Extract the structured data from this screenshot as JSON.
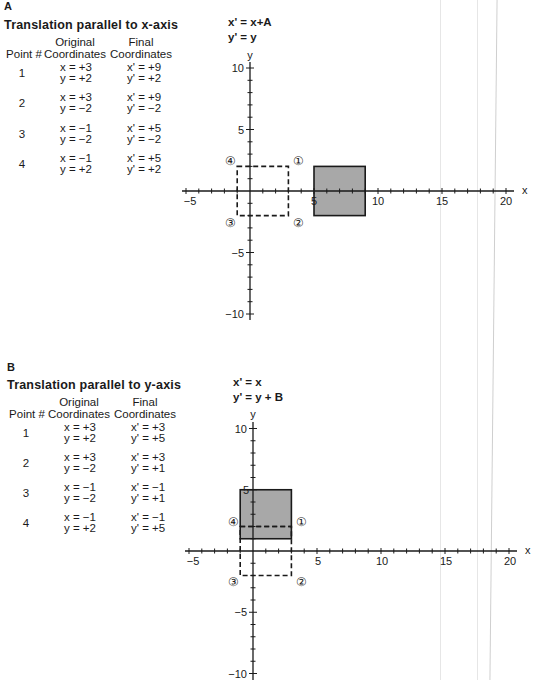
{
  "panels": [
    {
      "letter": "A",
      "title": "Translation parallel to x-axis",
      "headers": {
        "point": "Point #",
        "original_line1": "Original",
        "original_line2": "Coordinates",
        "final_line1": "Final",
        "final_line2": "Coordinates"
      },
      "rows": [
        {
          "point": "1",
          "ox": "x = +3",
          "oy": "y = +2",
          "fx": "x' = +9",
          "fy": "y' = +2"
        },
        {
          "point": "2",
          "ox": "x = +3",
          "oy": "y = −2",
          "fx": "x' = +9",
          "fy": "y' = −2"
        },
        {
          "point": "3",
          "ox": "x = −1",
          "oy": "y = −2",
          "fx": "x' = +5",
          "fy": "y' = −2"
        },
        {
          "point": "4",
          "ox": "x = −1",
          "oy": "y = +2",
          "fx": "x' = +5",
          "fy": "y' = +2"
        }
      ],
      "equations": {
        "line1": "x' = x+A",
        "line2": "y' = y"
      },
      "graph": {
        "x_label": "x",
        "y_label": "y",
        "x_ticks": [
          "−5",
          "5",
          "10",
          "15",
          "20"
        ],
        "y_ticks": [
          "10",
          "5",
          "−5",
          "−10"
        ],
        "point_markers": [
          "①",
          "②",
          "③",
          "④"
        ],
        "original_rect": {
          "x1": -1,
          "x2": 3,
          "y1": -2,
          "y2": 2
        },
        "final_rect": {
          "x1": 5,
          "x2": 9,
          "y1": -2,
          "y2": 2
        }
      }
    },
    {
      "letter": "B",
      "title": "Translation parallel to y-axis",
      "headers": {
        "point": "Point #",
        "original_line1": "Original",
        "original_line2": "Coordinates",
        "final_line1": "Final",
        "final_line2": "Coordinates"
      },
      "rows": [
        {
          "point": "1",
          "ox": "x = +3",
          "oy": "y = +2",
          "fx": "x' = +3",
          "fy": "y' = +5"
        },
        {
          "point": "2",
          "ox": "x = +3",
          "oy": "y = −2",
          "fx": "x' = +3",
          "fy": "y' = +1"
        },
        {
          "point": "3",
          "ox": "x = −1",
          "oy": "y = −2",
          "fx": "x' = −1",
          "fy": "y' = +1"
        },
        {
          "point": "4",
          "ox": "x = −1",
          "oy": "y = +2",
          "fx": "x' = −1",
          "fy": "y' = +5"
        }
      ],
      "equations": {
        "line1": "x' = x",
        "line2": "y' = y + B"
      },
      "graph": {
        "x_label": "x",
        "y_label": "y",
        "x_ticks": [
          "−5",
          "5",
          "10",
          "15",
          "20"
        ],
        "y_ticks": [
          "10",
          "5",
          "−5",
          "−10"
        ],
        "point_markers": [
          "①",
          "②",
          "③",
          "④"
        ],
        "original_rect": {
          "x1": -1,
          "x2": 3,
          "y1": -2,
          "y2": 2
        },
        "final_rect": {
          "x1": -1,
          "x2": 3,
          "y1": 1,
          "y2": 5
        }
      }
    }
  ],
  "colors": {
    "ink": "#1a1a1a",
    "fill": "#a8a8a8"
  }
}
